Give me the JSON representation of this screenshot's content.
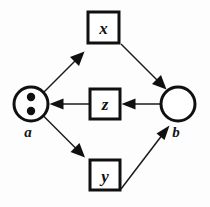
{
  "diagram": {
    "type": "petri-net-graph",
    "title": "",
    "places": [
      {
        "id": "a",
        "label": "a",
        "shape": "circle",
        "tokens": 2,
        "cx": 31,
        "cy": 104,
        "r": 17,
        "label_x": 28,
        "label_y": 137
      },
      {
        "id": "b",
        "label": "b",
        "shape": "circle",
        "tokens": 0,
        "cx": 178,
        "cy": 104,
        "r": 17,
        "label_x": 176,
        "label_y": 137
      }
    ],
    "transitions": [
      {
        "id": "x",
        "label": "x",
        "shape": "square",
        "x": 88,
        "y": 12,
        "w": 31,
        "h": 31,
        "label_x": 103,
        "label_y": 34
      },
      {
        "id": "z",
        "label": "z",
        "shape": "square",
        "x": 90,
        "y": 89,
        "w": 30,
        "h": 30,
        "label_x": 105,
        "label_y": 110
      },
      {
        "id": "y",
        "label": "y",
        "shape": "square",
        "x": 90,
        "y": 160,
        "w": 30,
        "h": 30,
        "label_x": 105,
        "label_y": 182
      }
    ],
    "edges": [
      {
        "id": "a-to-x",
        "from": "a",
        "to": "x",
        "direction": "a → x"
      },
      {
        "id": "x-to-b",
        "from": "x",
        "to": "b",
        "direction": "x → b"
      },
      {
        "id": "b-to-z",
        "from": "b",
        "to": "z",
        "direction": "b → z"
      },
      {
        "id": "z-to-a",
        "from": "z",
        "to": "a",
        "direction": "z → a"
      },
      {
        "id": "a-to-y",
        "from": "a",
        "to": "y",
        "direction": "a → y"
      },
      {
        "id": "y-to-b",
        "from": "y",
        "to": "b",
        "direction": "y → b"
      }
    ],
    "colors": {
      "stroke": "#101010",
      "background": "#fdfdfd",
      "token": "#101010"
    }
  }
}
